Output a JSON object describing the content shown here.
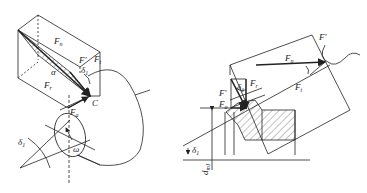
{
  "diagram": {
    "left_figure": {
      "labels": {
        "Fn": "F",
        "Fn_sub": "n",
        "Fprime": "F'",
        "Fr": "F",
        "Fr_sub": "r",
        "Ft": "F",
        "Ft_sub": "t",
        "Fa": "F",
        "Fa_sub": "a",
        "alpha": "α",
        "delta1_top": "δ",
        "delta1_top_sub": "1",
        "delta1_bottom": "δ",
        "delta1_bottom_sub": "1",
        "C": "C",
        "omega": "ω"
      }
    },
    "right_figure": {
      "labels": {
        "Fprime_top": "F'",
        "Fn": "F",
        "Fn_sub": "n",
        "Ft": "F",
        "Ft_sub": "t",
        "Fr": "F",
        "Fr_sub": "r",
        "Fprime_left": "F'",
        "Fa": "F",
        "Fa_sub": "a",
        "delta1_small": "δ",
        "delta1_small_sub": "1",
        "delta1_base": "δ",
        "delta1_base_sub": "1",
        "dm1": "d",
        "dm1_sub": "m1"
      }
    },
    "colors": {
      "line": "#222222",
      "background": "#ffffff"
    }
  }
}
